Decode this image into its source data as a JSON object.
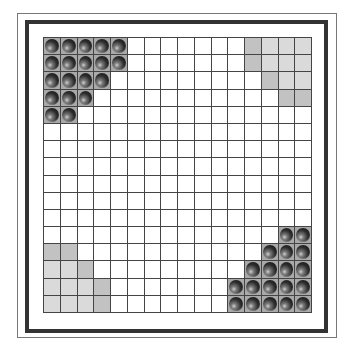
{
  "board": {
    "rows": 16,
    "cols": 16,
    "colors": {
      "grid_line": "#444444",
      "occupied_cell": "#a9a9a9",
      "camp_light": "#dadada",
      "camp_dark": "#c2c2c2",
      "piece": "#2c2c2c",
      "frame": "#333333"
    },
    "pieces": [
      [
        0,
        0
      ],
      [
        0,
        1
      ],
      [
        0,
        2
      ],
      [
        0,
        3
      ],
      [
        0,
        4
      ],
      [
        1,
        0
      ],
      [
        1,
        1
      ],
      [
        1,
        2
      ],
      [
        1,
        3
      ],
      [
        1,
        4
      ],
      [
        2,
        0
      ],
      [
        2,
        1
      ],
      [
        2,
        2
      ],
      [
        2,
        3
      ],
      [
        3,
        0
      ],
      [
        3,
        1
      ],
      [
        3,
        2
      ],
      [
        4,
        0
      ],
      [
        4,
        1
      ],
      [
        11,
        14
      ],
      [
        11,
        15
      ],
      [
        12,
        13
      ],
      [
        12,
        14
      ],
      [
        12,
        15
      ],
      [
        13,
        12
      ],
      [
        13,
        13
      ],
      [
        13,
        14
      ],
      [
        13,
        15
      ],
      [
        14,
        11
      ],
      [
        14,
        12
      ],
      [
        14,
        13
      ],
      [
        14,
        14
      ],
      [
        14,
        15
      ],
      [
        15,
        11
      ],
      [
        15,
        12
      ],
      [
        15,
        13
      ],
      [
        15,
        14
      ],
      [
        15,
        15
      ]
    ],
    "empty_camps": {
      "top_right": {
        "dark": [
          [
            0,
            12
          ],
          [
            1,
            12
          ],
          [
            2,
            13
          ],
          [
            3,
            14
          ],
          [
            3,
            15
          ]
        ],
        "light": [
          [
            0,
            13
          ],
          [
            0,
            14
          ],
          [
            0,
            15
          ],
          [
            1,
            13
          ],
          [
            1,
            14
          ],
          [
            1,
            15
          ],
          [
            2,
            14
          ],
          [
            2,
            15
          ]
        ]
      },
      "bottom_left": {
        "dark": [
          [
            12,
            0
          ],
          [
            12,
            1
          ],
          [
            13,
            2
          ],
          [
            14,
            3
          ],
          [
            15,
            3
          ]
        ],
        "light": [
          [
            13,
            0
          ],
          [
            13,
            1
          ],
          [
            14,
            0
          ],
          [
            14,
            1
          ],
          [
            14,
            2
          ],
          [
            15,
            0
          ],
          [
            15,
            1
          ],
          [
            15,
            2
          ]
        ]
      }
    }
  }
}
